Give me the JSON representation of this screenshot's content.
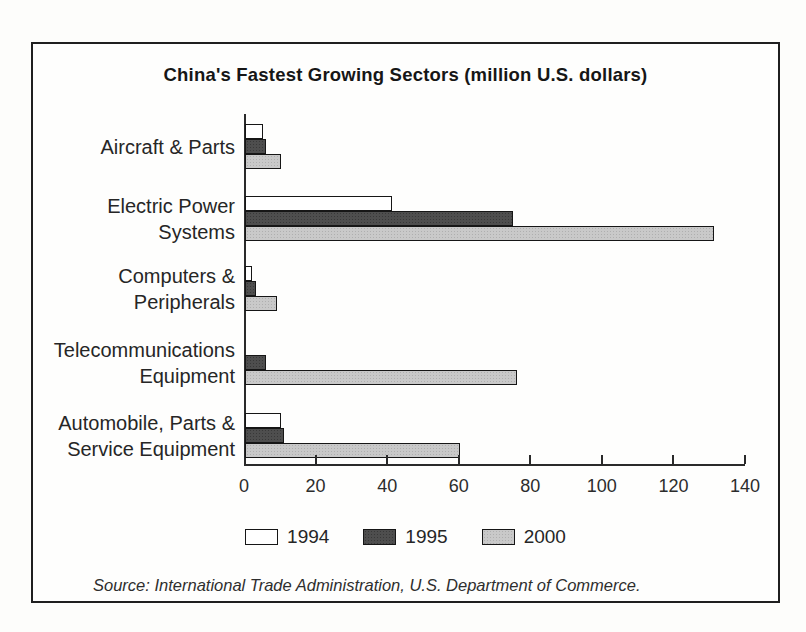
{
  "figure": {
    "title": "China's Fastest Growing Sectors (million U.S. dollars)",
    "source": "Source: International Trade Administration, U.S. Department of Commerce."
  },
  "chart_data": {
    "type": "bar",
    "orientation": "horizontal",
    "title": "China's Fastest Growing Sectors (million U.S. dollars)",
    "categories": [
      "Aircraft & Parts",
      "Electric Power\nSystems",
      "Computers &\nPeripherals",
      "Telecommunications\nEquipment",
      "Automobile, Parts &\nService Equipment"
    ],
    "series": [
      {
        "name": "1994",
        "color": "#ffffff",
        "values": [
          5,
          41,
          2,
          0,
          10
        ]
      },
      {
        "name": "1995",
        "color": "#4e4e4e",
        "values": [
          6,
          75,
          3,
          6,
          11
        ]
      },
      {
        "name": "2000",
        "color": "#c9c9c9",
        "values": [
          10,
          131,
          9,
          76,
          60
        ]
      }
    ],
    "x_ticks": [
      0,
      20,
      40,
      60,
      80,
      100,
      120,
      140
    ],
    "xlim": [
      0,
      140
    ],
    "grid": false,
    "legend_position": "bottom",
    "source": "Source: International Trade Administration, U.S. Department of Commerce."
  }
}
